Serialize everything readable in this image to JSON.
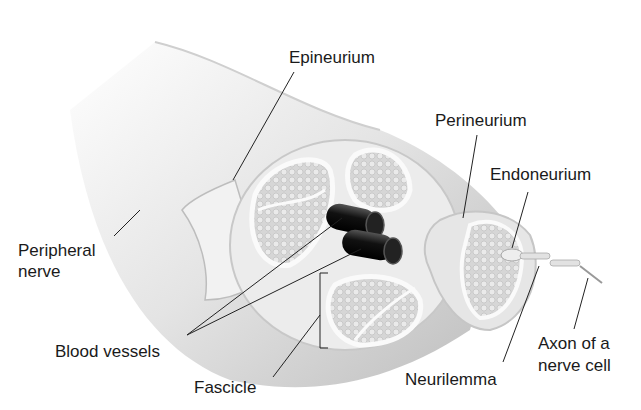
{
  "diagram": {
    "labels": {
      "epineurium": "Epineurium",
      "perineurium": "Perineurium",
      "endoneurium": "Endoneurium",
      "peripheral_nerve_1": "Peripheral",
      "peripheral_nerve_2": "nerve",
      "blood_vessels": "Blood vessels",
      "fascicle": "Fascicle",
      "neurilemma": "Neurilemma",
      "axon_1": "Axon of a",
      "axon_2": "nerve cell"
    }
  }
}
